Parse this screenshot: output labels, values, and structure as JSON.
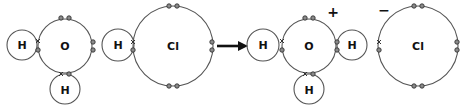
{
  "diagram": {
    "reactants": {
      "water": {
        "central_atom": "O",
        "hydrogens": [
          "H",
          "H"
        ]
      },
      "hydrogen_chloride": {
        "atoms": [
          "H",
          "Cl"
        ]
      }
    },
    "products": {
      "hydronium": {
        "central_atom": "O",
        "hydrogens": [
          "H",
          "H",
          "H"
        ],
        "charge": "+"
      },
      "chloride": {
        "atom": "Cl",
        "charge": "−"
      }
    },
    "arrow": "reaction-arrow",
    "legend": {
      "dot": "electron from O/Cl",
      "cross": "electron from H"
    },
    "colors": {
      "shell": "#555555",
      "electron_fill": "#8a8a8a",
      "text": "#111111"
    }
  }
}
